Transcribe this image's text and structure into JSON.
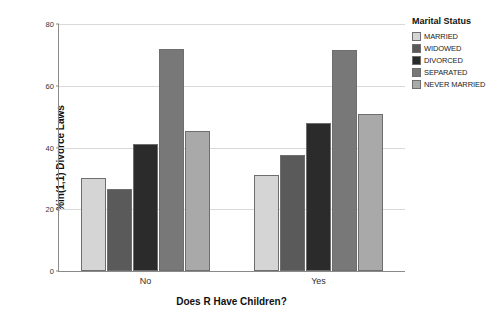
{
  "chart_data": {
    "type": "bar",
    "title": "",
    "xlabel": "Does R Have Children?",
    "ylabel": "%in(1,1) Divorce Laws",
    "categories": [
      "No",
      "Yes"
    ],
    "ylim": [
      0,
      80
    ],
    "yticks": [
      0,
      20,
      40,
      60,
      80
    ],
    "ytick_labels": [
      "0",
      "20",
      "40",
      "60",
      "80"
    ],
    "grid": true,
    "legend_title": "Marital Status",
    "legend_position": "right",
    "series": [
      {
        "name": "MARRIED",
        "color": "#d5d5d5",
        "values": [
          30.0,
          31.0
        ]
      },
      {
        "name": "WIDOWED",
        "color": "#5a5a5a",
        "values": [
          26.5,
          37.5
        ]
      },
      {
        "name": "DIVORCED",
        "color": "#2b2b2b",
        "values": [
          41.0,
          48.0
        ]
      },
      {
        "name": "SEPARATED",
        "color": "#787878",
        "values": [
          72.0,
          71.5
        ]
      },
      {
        "name": "NEVER MARRIED",
        "color": "#a9a9a9",
        "values": [
          45.5,
          51.0
        ]
      }
    ]
  }
}
